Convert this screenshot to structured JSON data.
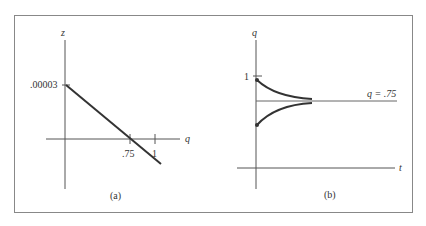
{
  "figure": {
    "panel_a": {
      "caption": "(a)",
      "y_axis_label": "z",
      "x_axis_label": "q",
      "y_tick_label": ".00003",
      "x_tick_labels": [
        ".75",
        "1"
      ],
      "line": {
        "from": {
          "q": 0,
          "z": 3e-05
        },
        "to_desc": "decreasing, crosses q axis at .75"
      }
    },
    "panel_b": {
      "caption": "(b)",
      "y_axis_label": "q",
      "x_axis_label": "t",
      "y_tick_label": "1",
      "equilibrium_label": "q = .75",
      "curves": [
        "decreasing from near 1 toward .75",
        "increasing from below toward .75"
      ]
    }
  }
}
